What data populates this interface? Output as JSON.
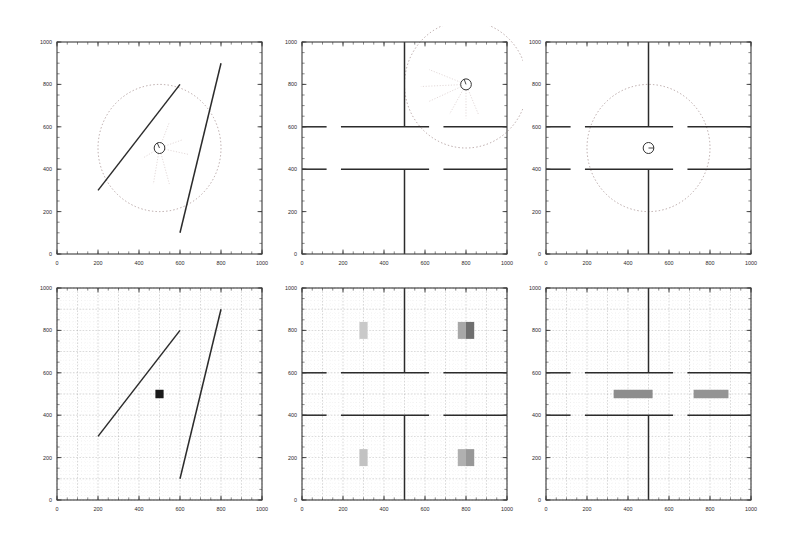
{
  "figure": {
    "width": 795,
    "height": 539,
    "background": "#ffffff",
    "rows": 2,
    "cols": 3,
    "axis_color": "#3a3a3a",
    "wall_color": "#2b2b2b",
    "grid_color": "#b9b9b9",
    "grid_major_color": "#9a9a9a",
    "sensor_circle_color": "#a08a8a",
    "beam_color": "#cbb9b9",
    "robot_color": "#333333",
    "occupancy_light": "#c8c8c8",
    "occupancy_mid": "#9e9e9e",
    "occupancy_dark": "#6e6e6e",
    "marker_color": "#1a1a1a"
  },
  "axes": {
    "xlim": [
      0,
      1000
    ],
    "ylim": [
      0,
      1000
    ],
    "xticks": [
      0,
      200,
      400,
      600,
      800,
      1000
    ],
    "yticks": [
      0,
      200,
      400,
      600,
      800,
      1000
    ],
    "xtick_labels": [
      "0",
      "200",
      "400",
      "600",
      "800",
      "1000"
    ],
    "ytick_labels": [
      "0",
      "200",
      "400",
      "600",
      "800",
      "1000"
    ],
    "minor_tick_count": 20,
    "grid": false
  },
  "chart_data": [
    {
      "id": "panel-1",
      "type": "scatter",
      "title": "",
      "xlabel": "",
      "ylabel": "",
      "xlim": [
        0,
        1000
      ],
      "ylim": [
        0,
        1000
      ],
      "environment": "two-oblique-walls",
      "robot": {
        "x": 500,
        "y": 500,
        "radius": 26,
        "heading_deg": 115
      },
      "sensor_range": {
        "cx": 500,
        "cy": 500,
        "radius": 300,
        "style": "dotted"
      },
      "walls": [
        {
          "x1": 200,
          "y1": 300,
          "x2": 600,
          "y2": 800
        },
        {
          "x1": 600,
          "y1": 100,
          "x2": 800,
          "y2": 900
        }
      ],
      "beams": [
        {
          "x1": 500,
          "y1": 500,
          "x2": 548,
          "y2": 621
        },
        {
          "x1": 500,
          "y1": 500,
          "x2": 610,
          "y2": 538
        },
        {
          "x1": 500,
          "y1": 500,
          "x2": 640,
          "y2": 470
        },
        {
          "x1": 500,
          "y1": 500,
          "x2": 548,
          "y2": 330
        },
        {
          "x1": 500,
          "y1": 500,
          "x2": 470,
          "y2": 330
        },
        {
          "x1": 500,
          "y1": 500,
          "x2": 418,
          "y2": 452
        }
      ]
    },
    {
      "id": "panel-2",
      "type": "scatter",
      "title": "",
      "xlabel": "",
      "ylabel": "",
      "xlim": [
        0,
        1000
      ],
      "ylim": [
        0,
        1000
      ],
      "environment": "four-room-corridor",
      "robot": {
        "x": 800,
        "y": 800,
        "radius": 26,
        "heading_deg": 110
      },
      "sensor_range": {
        "cx": 800,
        "cy": 800,
        "radius": 300,
        "style": "dotted"
      },
      "walls": [
        {
          "x1": 0,
          "y1": 600,
          "x2": 120,
          "y2": 600
        },
        {
          "x1": 190,
          "y1": 600,
          "x2": 620,
          "y2": 600
        },
        {
          "x1": 690,
          "y1": 600,
          "x2": 1000,
          "y2": 600
        },
        {
          "x1": 0,
          "y1": 400,
          "x2": 120,
          "y2": 400
        },
        {
          "x1": 190,
          "y1": 400,
          "x2": 620,
          "y2": 400
        },
        {
          "x1": 690,
          "y1": 400,
          "x2": 1000,
          "y2": 400
        },
        {
          "x1": 500,
          "y1": 600,
          "x2": 500,
          "y2": 1000
        },
        {
          "x1": 500,
          "y1": 0,
          "x2": 500,
          "y2": 400
        }
      ],
      "beams": [
        {
          "x1": 800,
          "y1": 800,
          "x2": 860,
          "y2": 660
        },
        {
          "x1": 800,
          "y1": 800,
          "x2": 800,
          "y2": 640
        },
        {
          "x1": 800,
          "y1": 800,
          "x2": 720,
          "y2": 660
        },
        {
          "x1": 800,
          "y1": 800,
          "x2": 620,
          "y2": 720
        },
        {
          "x1": 800,
          "y1": 800,
          "x2": 580,
          "y2": 790
        },
        {
          "x1": 800,
          "y1": 800,
          "x2": 620,
          "y2": 870
        }
      ]
    },
    {
      "id": "panel-3",
      "type": "scatter",
      "title": "",
      "xlabel": "",
      "ylabel": "",
      "xlim": [
        0,
        1000
      ],
      "ylim": [
        0,
        1000
      ],
      "environment": "four-room-corridor",
      "robot": {
        "x": 500,
        "y": 500,
        "radius": 26,
        "heading_deg": 0
      },
      "sensor_range": {
        "cx": 500,
        "cy": 500,
        "radius": 300,
        "style": "dotted"
      },
      "walls": [
        {
          "x1": 0,
          "y1": 600,
          "x2": 120,
          "y2": 600
        },
        {
          "x1": 190,
          "y1": 600,
          "x2": 620,
          "y2": 600
        },
        {
          "x1": 690,
          "y1": 600,
          "x2": 1000,
          "y2": 600
        },
        {
          "x1": 0,
          "y1": 400,
          "x2": 120,
          "y2": 400
        },
        {
          "x1": 190,
          "y1": 400,
          "x2": 620,
          "y2": 400
        },
        {
          "x1": 690,
          "y1": 400,
          "x2": 1000,
          "y2": 400
        },
        {
          "x1": 500,
          "y1": 600,
          "x2": 500,
          "y2": 1000
        },
        {
          "x1": 500,
          "y1": 0,
          "x2": 500,
          "y2": 400
        }
      ],
      "beams": []
    },
    {
      "id": "panel-4",
      "type": "heatmap",
      "title": "",
      "xlabel": "",
      "ylabel": "",
      "xlim": [
        0,
        1000
      ],
      "ylim": [
        0,
        1000
      ],
      "environment": "two-oblique-walls-occupancy",
      "grid": true,
      "grid_cell": 20,
      "grid_major_every": 5,
      "walls": [
        {
          "x1": 200,
          "y1": 300,
          "x2": 600,
          "y2": 800
        },
        {
          "x1": 600,
          "y1": 100,
          "x2": 800,
          "y2": 900
        }
      ],
      "occupancy_cells": [
        {
          "x": 480,
          "y": 480,
          "w": 40,
          "h": 40,
          "shade": "#1a1a1a"
        }
      ]
    },
    {
      "id": "panel-5",
      "type": "heatmap",
      "title": "",
      "xlabel": "",
      "ylabel": "",
      "xlim": [
        0,
        1000
      ],
      "ylim": [
        0,
        1000
      ],
      "environment": "four-room-corridor-occupancy",
      "grid": true,
      "grid_cell": 20,
      "grid_major_every": 5,
      "walls": [
        {
          "x1": 0,
          "y1": 600,
          "x2": 120,
          "y2": 600
        },
        {
          "x1": 190,
          "y1": 600,
          "x2": 620,
          "y2": 600
        },
        {
          "x1": 690,
          "y1": 600,
          "x2": 1000,
          "y2": 600
        },
        {
          "x1": 0,
          "y1": 400,
          "x2": 120,
          "y2": 400
        },
        {
          "x1": 190,
          "y1": 400,
          "x2": 620,
          "y2": 400
        },
        {
          "x1": 690,
          "y1": 400,
          "x2": 1000,
          "y2": 400
        },
        {
          "x1": 500,
          "y1": 600,
          "x2": 500,
          "y2": 1000
        },
        {
          "x1": 500,
          "y1": 0,
          "x2": 500,
          "y2": 400
        }
      ],
      "occupancy_cells": [
        {
          "x": 280,
          "y": 760,
          "w": 40,
          "h": 80,
          "shade": "#c9c9c9"
        },
        {
          "x": 760,
          "y": 760,
          "w": 40,
          "h": 80,
          "shade": "#a8a8a8"
        },
        {
          "x": 800,
          "y": 760,
          "w": 40,
          "h": 80,
          "shade": "#6f6f6f"
        },
        {
          "x": 280,
          "y": 160,
          "w": 40,
          "h": 80,
          "shade": "#c2c2c2"
        },
        {
          "x": 760,
          "y": 160,
          "w": 40,
          "h": 80,
          "shade": "#b0b0b0"
        },
        {
          "x": 800,
          "y": 160,
          "w": 40,
          "h": 80,
          "shade": "#989898"
        }
      ]
    },
    {
      "id": "panel-6",
      "type": "heatmap",
      "title": "",
      "xlabel": "",
      "ylabel": "",
      "xlim": [
        0,
        1000
      ],
      "ylim": [
        0,
        1000
      ],
      "environment": "four-room-corridor-occupancy",
      "grid": true,
      "grid_cell": 20,
      "grid_major_every": 5,
      "walls": [
        {
          "x1": 0,
          "y1": 600,
          "x2": 120,
          "y2": 600
        },
        {
          "x1": 190,
          "y1": 600,
          "x2": 620,
          "y2": 600
        },
        {
          "x1": 690,
          "y1": 600,
          "x2": 1000,
          "y2": 600
        },
        {
          "x1": 0,
          "y1": 400,
          "x2": 120,
          "y2": 400
        },
        {
          "x1": 190,
          "y1": 400,
          "x2": 620,
          "y2": 400
        },
        {
          "x1": 690,
          "y1": 400,
          "x2": 1000,
          "y2": 400
        },
        {
          "x1": 500,
          "y1": 600,
          "x2": 500,
          "y2": 1000
        },
        {
          "x1": 500,
          "y1": 0,
          "x2": 500,
          "y2": 400
        }
      ],
      "occupancy_cells": [
        {
          "x": 330,
          "y": 480,
          "w": 190,
          "h": 40,
          "shade": "#8d8d8d"
        },
        {
          "x": 720,
          "y": 480,
          "w": 170,
          "h": 40,
          "shade": "#949494"
        }
      ]
    }
  ]
}
